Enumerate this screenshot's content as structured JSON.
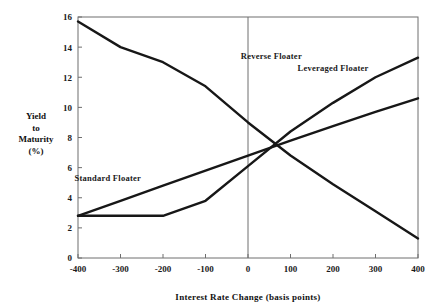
{
  "chart_data": {
    "type": "line",
    "title": "",
    "xlabel": "Interest Rate Change (basis points)",
    "ylabel": "Yield to Maturity (%)",
    "ylabel_lines": [
      "Yield",
      "to",
      "Maturity",
      "(%)"
    ],
    "xlim": [
      -400,
      400
    ],
    "ylim": [
      0,
      16
    ],
    "xticks": [
      -400,
      -300,
      -200,
      -100,
      0,
      100,
      200,
      300,
      400
    ],
    "xtick_labels": [
      "-400",
      "-300",
      "-200",
      "-100",
      "0",
      "100",
      "200",
      "300",
      "400"
    ],
    "yticks": [
      0,
      2,
      4,
      6,
      8,
      10,
      12,
      14,
      16
    ],
    "ytick_labels": [
      "0",
      "2",
      "4",
      "6",
      "8",
      "10",
      "12",
      "14",
      "16"
    ],
    "grid": false,
    "legend_position": "inline-annotations",
    "zero_reference_line": 0,
    "series": [
      {
        "name": "Reverse Floater",
        "label": "Reverse Floater",
        "label_x": 55,
        "label_y": 13.2,
        "x": [
          -400,
          -300,
          -200,
          -100,
          0,
          100,
          200,
          300,
          400
        ],
        "values": [
          15.7,
          14.0,
          13.0,
          11.4,
          9.0,
          6.8,
          4.9,
          3.1,
          1.3
        ]
      },
      {
        "name": "Leveraged Floater",
        "label": "Leveraged Floater",
        "label_x": 200,
        "label_y": 12.4,
        "x": [
          -400,
          -300,
          -200,
          -100,
          0,
          100,
          200,
          300,
          400
        ],
        "values": [
          2.8,
          2.8,
          2.8,
          3.8,
          6.1,
          8.4,
          10.3,
          12.0,
          13.3
        ]
      },
      {
        "name": "Standard Floater",
        "label": "Standard Floater",
        "label_x": -330,
        "label_y": 5.1,
        "x": [
          -400,
          -300,
          -200,
          -100,
          0,
          100,
          200,
          300,
          400
        ],
        "values": [
          2.8,
          3.8,
          4.8,
          5.8,
          6.8,
          7.8,
          8.75,
          9.7,
          10.6
        ]
      }
    ]
  }
}
